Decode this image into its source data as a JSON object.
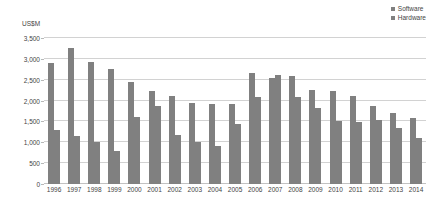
{
  "chart_data": {
    "type": "bar",
    "title": "",
    "xlabel": "",
    "ylabel": "US$M",
    "ylim": [
      0,
      3500
    ],
    "yticks": [
      "0",
      "500",
      "1,000",
      "1,500",
      "2,000",
      "2,500",
      "3,000",
      "3,500"
    ],
    "ytick_values": [
      0,
      500,
      1000,
      1500,
      2000,
      2500,
      3000,
      3500
    ],
    "grid": true,
    "legend_position": "top-right",
    "categories": [
      "1996",
      "1997",
      "1998",
      "1999",
      "2000",
      "2001",
      "2002",
      "2003",
      "2004",
      "2005",
      "2006",
      "2007",
      "2008",
      "2009",
      "2010",
      "2011",
      "2012",
      "2013",
      "2014"
    ],
    "series": [
      {
        "name": "Software",
        "color": "#808080",
        "values": [
          2900,
          3250,
          2930,
          2750,
          2450,
          2220,
          2100,
          1950,
          1930,
          1930,
          2650,
          2540,
          2580,
          2250,
          2230,
          2100,
          1870,
          1700,
          1580
        ]
      },
      {
        "name": "Hardware",
        "color": "#808080",
        "values": [
          1300,
          1150,
          1000,
          800,
          1600,
          1870,
          1180,
          1000,
          920,
          1430,
          2080,
          2620,
          2080,
          1830,
          1500,
          1480,
          1530,
          1350,
          1100
        ]
      }
    ]
  },
  "legend": {
    "items": [
      {
        "label": "Software",
        "marker": "square-marker"
      },
      {
        "label": "Hardware",
        "marker": "square-marker"
      }
    ]
  },
  "colors": {
    "software": "#808080",
    "hardware": "#808080",
    "gridline": "#d2d2d2",
    "text": "#444444",
    "background": "#ffffff"
  }
}
